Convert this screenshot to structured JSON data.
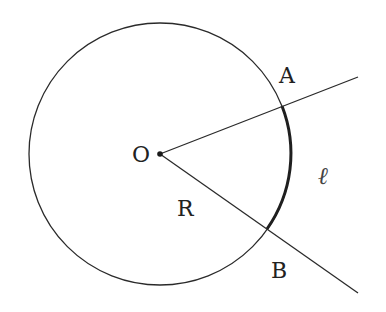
{
  "diagram": {
    "title": "",
    "type": "circle-sector-arc",
    "colors": {
      "stroke": "#2a2a2a",
      "arc_highlight": "#1f1f1f",
      "background": "#ffffff",
      "label": "#222222"
    },
    "circle": {
      "center": {
        "x": 160,
        "y": 154
      },
      "radius": 131
    },
    "rays": [
      {
        "name": "ray-OA",
        "from": {
          "x": 160,
          "y": 154
        },
        "to": {
          "x": 358,
          "y": 77
        }
      },
      {
        "name": "ray-OB",
        "from": {
          "x": 160,
          "y": 154
        },
        "to": {
          "x": 358,
          "y": 293
        }
      }
    ],
    "points": {
      "A": {
        "x": 282,
        "y": 106
      },
      "B": {
        "x": 267,
        "y": 229
      }
    },
    "labels": {
      "center": "O",
      "point_a": "A",
      "point_b": "B",
      "radius": "R",
      "arc_length": "ℓ"
    }
  }
}
